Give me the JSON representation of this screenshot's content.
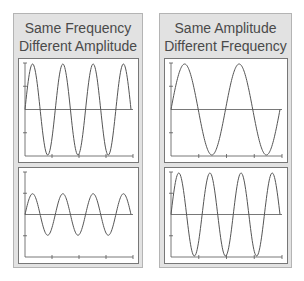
{
  "panels": [
    {
      "title_line1": "Same Frequency",
      "title_line2": "Different Amplitude",
      "plots": [
        {
          "name": "high-amplitude-wave",
          "amplitude": 1.0,
          "cycles": 3.5
        },
        {
          "name": "low-amplitude-wave",
          "amplitude": 0.5,
          "cycles": 3.5
        }
      ]
    },
    {
      "title_line1": "Same Amplitude",
      "title_line2": "Different Frequency",
      "plots": [
        {
          "name": "low-frequency-wave",
          "amplitude": 1.0,
          "cycles": 2.0
        },
        {
          "name": "high-frequency-wave",
          "amplitude": 1.0,
          "cycles": 3.5
        }
      ]
    }
  ],
  "colors": {
    "panel_bg": "#e2e2e2",
    "panel_border": "#b4b4b4",
    "plot_bg": "#ffffff",
    "wave": "#555555",
    "axis": "#555555",
    "title": "#4a4a4a"
  }
}
